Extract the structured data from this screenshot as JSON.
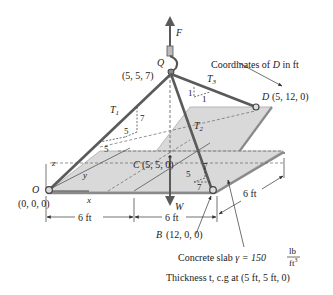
{
  "diagram": {
    "force_label": "F",
    "weight_label": "W",
    "point_Q": {
      "name": "Q",
      "coords": "(5, 5, 7)"
    },
    "point_O": {
      "name": "O",
      "coords": "(0, 0, 0)"
    },
    "point_C": {
      "name": "C",
      "coords": "(5, 5, 0)"
    },
    "point_B": {
      "name": "B",
      "coords": "(12, 0, 0)"
    },
    "point_D": {
      "name": "D",
      "coords": "(5, 12, 0)"
    },
    "tensions": {
      "t1": "T",
      "t1_sub": "1",
      "t2": "T",
      "t2_sub": "2",
      "t3": "T",
      "t3_sub": "3"
    },
    "slopes": {
      "t1_rise": "7",
      "t1_run_a": "5",
      "t1_run_b": "5",
      "t2_rise": "7",
      "t2_run_a": "5",
      "t2_run_b": "7",
      "t3_rise": "1",
      "t3_run": "1"
    },
    "axes": {
      "x": "x",
      "y": "y",
      "z": "z"
    },
    "dimensions": {
      "dim1": "6 ft",
      "dim2": "6 ft",
      "dim3": "6 ft"
    },
    "annotations": {
      "coords_note": "Coordinates of ",
      "coords_note_point": "D",
      "coords_note_tail": " in ft",
      "slab_text": "Concrete slab ",
      "gamma": "γ = 150",
      "unit_num": "lb",
      "unit_den": "ft",
      "unit_exp": "3",
      "thickness": "Thickness t, c.g at (5 ft, 5 ft, 0)"
    },
    "colors": {
      "cable": "#5a5a5a",
      "slab_fill": "#d9d9d9",
      "slab_edge": "#8a8a8a",
      "text": "#222222"
    }
  }
}
